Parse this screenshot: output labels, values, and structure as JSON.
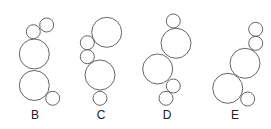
{
  "figure": {
    "stroke_color": "#555555",
    "options": [
      {
        "label": "B",
        "label_pos": [
          35,
          119
        ],
        "circles": [
          {
            "cx": 46.7,
            "cy": 25,
            "r": 7
          },
          {
            "cx": 33.3,
            "cy": 31.7,
            "r": 7
          },
          {
            "cx": 34.3,
            "cy": 54,
            "r": 15
          },
          {
            "cx": 34.3,
            "cy": 85.5,
            "r": 15
          },
          {
            "cx": 52.7,
            "cy": 98.3,
            "r": 7
          }
        ]
      },
      {
        "label": "C",
        "label_pos": [
          101,
          119
        ],
        "circles": [
          {
            "cx": 106.7,
            "cy": 32.3,
            "r": 15
          },
          {
            "cx": 87.3,
            "cy": 42.7,
            "r": 7
          },
          {
            "cx": 87.3,
            "cy": 56.7,
            "r": 7
          },
          {
            "cx": 100,
            "cy": 75,
            "r": 15
          },
          {
            "cx": 100,
            "cy": 98.3,
            "r": 7
          }
        ]
      },
      {
        "label": "D",
        "label_pos": [
          167,
          119
        ],
        "circles": [
          {
            "cx": 173.3,
            "cy": 21,
            "r": 7
          },
          {
            "cx": 176,
            "cy": 43.3,
            "r": 15
          },
          {
            "cx": 157.7,
            "cy": 69,
            "r": 15
          },
          {
            "cx": 173.3,
            "cy": 86,
            "r": 7
          },
          {
            "cx": 166,
            "cy": 98.3,
            "r": 7
          }
        ]
      },
      {
        "label": "E",
        "label_pos": [
          235,
          119
        ],
        "circles": [
          {
            "cx": 255.7,
            "cy": 29.3,
            "r": 7
          },
          {
            "cx": 255.7,
            "cy": 43.3,
            "r": 7
          },
          {
            "cx": 245,
            "cy": 63.3,
            "r": 15
          },
          {
            "cx": 227.7,
            "cy": 88.3,
            "r": 15
          },
          {
            "cx": 247.7,
            "cy": 99,
            "r": 7
          }
        ]
      }
    ]
  }
}
